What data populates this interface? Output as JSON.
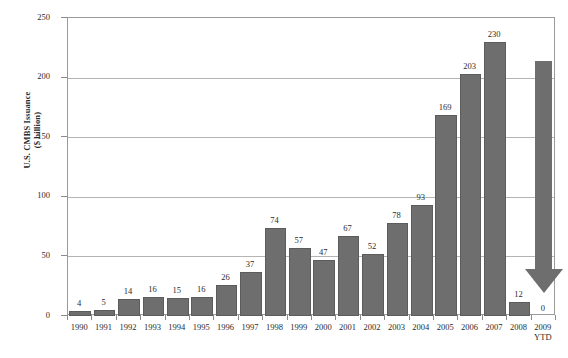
{
  "chart_data": {
    "type": "bar",
    "title": "",
    "xlabel": "",
    "ylabel": "U.S. CMBS Issuance\n($ billion)",
    "ylim": [
      0,
      250
    ],
    "yticks": [
      0,
      50,
      100,
      150,
      200,
      250
    ],
    "grid": true,
    "legend": "none",
    "categories": [
      "1990",
      "1991",
      "1992",
      "1993",
      "1994",
      "1995",
      "1996",
      "1997",
      "1998",
      "1999",
      "2000",
      "2001",
      "2002",
      "2003",
      "2004",
      "2005",
      "2006",
      "2007",
      "2008",
      "2009"
    ],
    "category_sublabels": [
      "",
      "",
      "",
      "",
      "",
      "",
      "",
      "",
      "",
      "",
      "",
      "",
      "",
      "",
      "",
      "",
      "",
      "",
      "",
      "YTD"
    ],
    "values": [
      4,
      5,
      14,
      16,
      15,
      16,
      26,
      37,
      74,
      57,
      47,
      67,
      52,
      78,
      93,
      169,
      203,
      230,
      12,
      0
    ],
    "value_labels": [
      "4",
      "5",
      "14",
      "16",
      "15",
      "16",
      "26",
      "37",
      "74",
      "57",
      "47",
      "67",
      "52",
      "78",
      "93",
      "169",
      "203",
      "230",
      "12",
      "0"
    ],
    "bar_color": "#6e6e6e",
    "annotations": [
      {
        "name": "downward-trend-arrow",
        "type": "arrow",
        "direction": "down",
        "color": "#6e6e6e"
      }
    ]
  }
}
